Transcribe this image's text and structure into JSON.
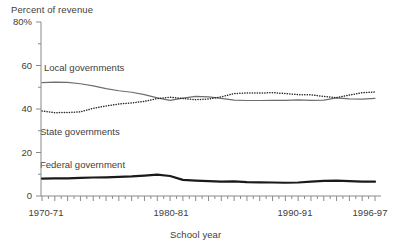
{
  "chart_data": {
    "type": "line",
    "title": "Percent of revenue",
    "xlabel": "School year",
    "ylabel": "Percent of revenue",
    "ylim": [
      0,
      80
    ],
    "ytick_labels": [
      "0",
      "20",
      "40",
      "60",
      "80%"
    ],
    "ytick_values": [
      0,
      20,
      40,
      60,
      80
    ],
    "grid": false,
    "legend_position": "inline-annotations",
    "x": [
      "1970-71",
      "1971-72",
      "1972-73",
      "1973-74",
      "1974-75",
      "1975-76",
      "1976-77",
      "1977-78",
      "1978-79",
      "1979-80",
      "1980-81",
      "1981-82",
      "1982-83",
      "1983-84",
      "1984-85",
      "1985-86",
      "1986-87",
      "1987-88",
      "1988-89",
      "1989-90",
      "1990-91",
      "1991-92",
      "1992-93",
      "1993-94",
      "1994-95",
      "1995-96",
      "1996-97"
    ],
    "xtick_labels": [
      "1970-71",
      "1980-81",
      "1990-91",
      "1996-97"
    ],
    "xtick_index": [
      0,
      10,
      20,
      26
    ],
    "series": [
      {
        "name": "Local governments",
        "style": "solid",
        "color": "#6e6e6e",
        "width": 1.2,
        "values": [
          52.1,
          52.4,
          52.2,
          51.6,
          50.6,
          49.4,
          48.4,
          47.7,
          46.6,
          45.1,
          44.0,
          45.0,
          45.8,
          45.6,
          44.9,
          44.1,
          43.9,
          43.9,
          44.0,
          44.0,
          44.2,
          44.0,
          44.1,
          45.1,
          44.7,
          44.5,
          44.9
        ]
      },
      {
        "name": "State governments",
        "style": "dotted",
        "color": "#2b2b2b",
        "width": 1.5,
        "values": [
          39.1,
          38.3,
          38.4,
          38.7,
          40.3,
          41.4,
          42.3,
          42.8,
          43.5,
          44.8,
          45.4,
          44.8,
          44.3,
          44.6,
          45.6,
          47.1,
          47.4,
          47.3,
          47.5,
          47.1,
          46.6,
          46.5,
          45.8,
          45.2,
          46.4,
          47.5,
          47.8
        ]
      },
      {
        "name": "Federal government",
        "style": "solid",
        "color": "#1a1a1a",
        "width": 2.2,
        "values": [
          8.0,
          8.1,
          8.1,
          8.3,
          8.5,
          8.6,
          8.8,
          9.0,
          9.4,
          9.8,
          9.2,
          7.4,
          7.1,
          6.8,
          6.6,
          6.7,
          6.4,
          6.3,
          6.2,
          6.1,
          6.2,
          6.6,
          7.0,
          7.1,
          6.8,
          6.6,
          6.6
        ]
      }
    ],
    "annotations": [
      {
        "text": "Local governments",
        "series": "Local governments"
      },
      {
        "text": "State governments",
        "series": "State governments"
      },
      {
        "text": "Federal government",
        "series": "Federal government"
      }
    ]
  }
}
